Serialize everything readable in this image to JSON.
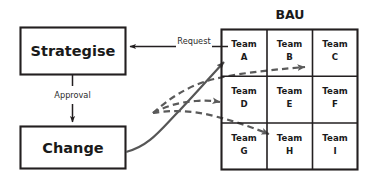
{
  "diagram": {
    "title": "BAU",
    "process_boxes": [
      {
        "id": "strategise",
        "label": "Strategise"
      },
      {
        "id": "change",
        "label": "Change"
      }
    ],
    "edge_labels": [
      {
        "id": "request",
        "label": "Request"
      },
      {
        "id": "approval",
        "label": "Approval"
      }
    ],
    "grid": {
      "title": "BAU",
      "rows": 3,
      "cols": 3,
      "cells": [
        {
          "line1": "Team",
          "line2": "A"
        },
        {
          "line1": "Team",
          "line2": "B"
        },
        {
          "line1": "Team",
          "line2": "C"
        },
        {
          "line1": "Team",
          "line2": "D"
        },
        {
          "line1": "Team",
          "line2": "E"
        },
        {
          "line1": "Team",
          "line2": "F"
        },
        {
          "line1": "Team",
          "line2": "G"
        },
        {
          "line1": "Team",
          "line2": "H"
        },
        {
          "line1": "Team",
          "line2": "I"
        }
      ]
    },
    "colors": {
      "stroke": "#231f20",
      "curve": "#4a4a4a",
      "background": "#ffffff",
      "text": "#1a1a1a"
    },
    "connectors": [
      {
        "id": "change-to-team-a",
        "style": "solid",
        "target": "Team A"
      },
      {
        "id": "fan-to-team-c",
        "style": "dashed",
        "target": "Team C"
      },
      {
        "id": "fan-to-team-d",
        "style": "dashed",
        "target": "Team D"
      },
      {
        "id": "fan-to-team-h",
        "style": "dashed",
        "target": "Team H"
      }
    ]
  }
}
